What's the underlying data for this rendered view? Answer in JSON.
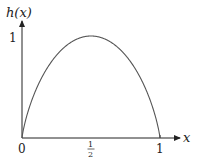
{
  "chart_data": {
    "type": "line",
    "title": "",
    "xlabel": "x",
    "ylabel": "h(x)",
    "xlim": [
      0,
      1
    ],
    "ylim": [
      0,
      1
    ],
    "grid": false,
    "legend": null,
    "x_ticks": [
      {
        "value": 0,
        "label": "0"
      },
      {
        "value": 0.5,
        "label": "1/2"
      },
      {
        "value": 1,
        "label": "1"
      }
    ],
    "y_ticks": [
      {
        "value": 1,
        "label": "1"
      }
    ],
    "series": [
      {
        "name": "h(x)",
        "function": "binary entropy: -x log2(x) - (1-x) log2(1-x)",
        "x": [
          0,
          0.05,
          0.1,
          0.2,
          0.3,
          0.4,
          0.5,
          0.6,
          0.7,
          0.8,
          0.9,
          0.95,
          1
        ],
        "values": [
          0,
          0.286,
          0.469,
          0.722,
          0.881,
          0.971,
          1.0,
          0.971,
          0.881,
          0.722,
          0.469,
          0.286,
          0
        ]
      }
    ]
  },
  "labels": {
    "y_axis": "h(x)",
    "x_axis": "x",
    "origin": "0",
    "x_half_num": "1",
    "x_half_den": "2",
    "x_one": "1",
    "y_one": "1"
  },
  "colors": {
    "axis": "#222222",
    "curve": "#555555"
  }
}
